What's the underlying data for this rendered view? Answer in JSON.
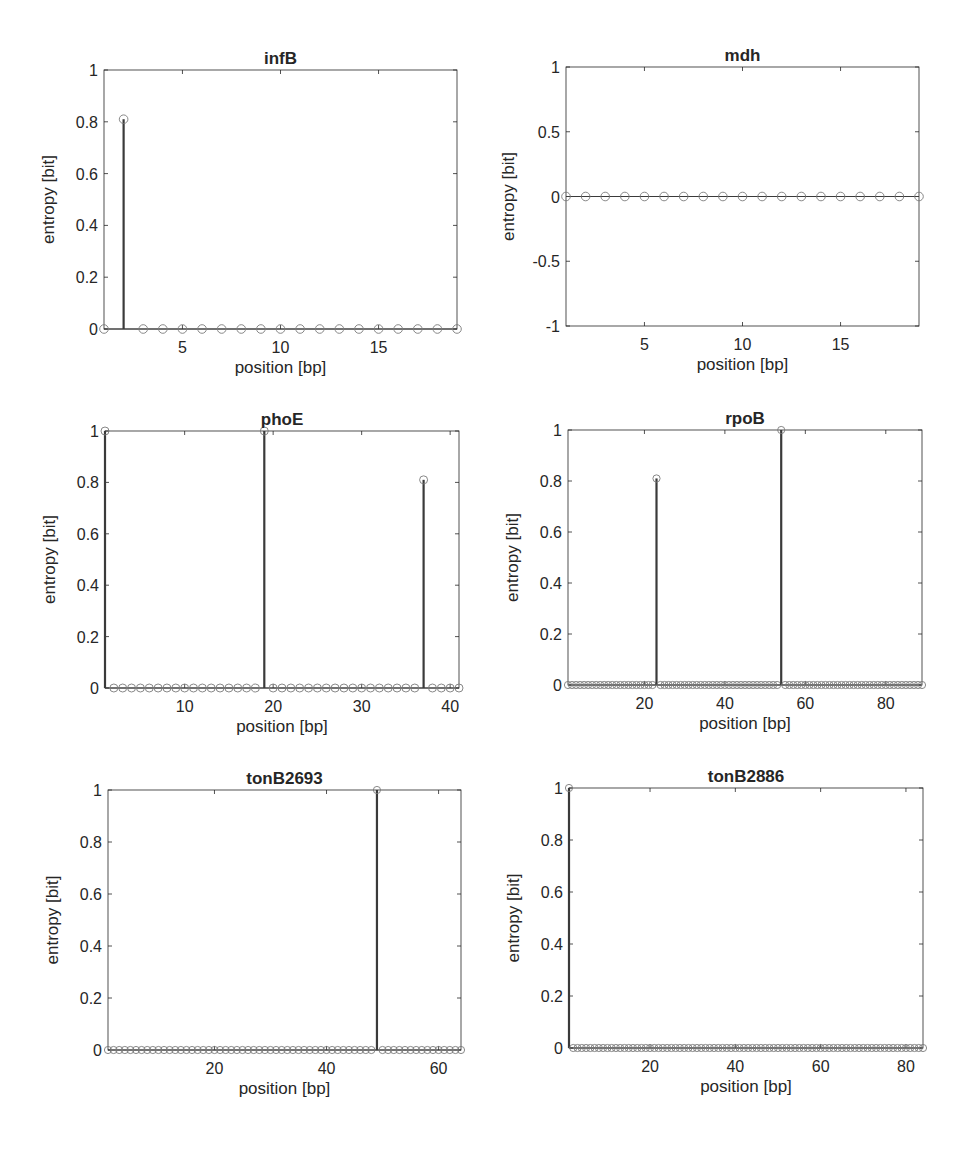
{
  "figure": {
    "width": 963,
    "height": 1150,
    "background": "#ffffff",
    "axis_color": "#262626",
    "stem_color": "#3a3a3a",
    "marker_color": "#7a7a7a"
  },
  "chart_data": [
    {
      "type": "stem",
      "title": "infB",
      "xlabel": "position [bp]",
      "ylabel": "entropy [bit]",
      "xlim": [
        1,
        19
      ],
      "ylim": [
        0,
        1
      ],
      "xticks": [
        5,
        10,
        15
      ],
      "xtick_labels": [
        "5",
        "10",
        "15"
      ],
      "yticks": [
        0,
        0.2,
        0.4,
        0.6,
        0.8,
        1
      ],
      "ytick_labels": [
        "0",
        "0.2",
        "0.4",
        "0.6",
        "0.8",
        "1"
      ],
      "grid": false,
      "x": [
        1,
        2,
        3,
        4,
        5,
        6,
        7,
        8,
        9,
        10,
        11,
        12,
        13,
        14,
        15,
        16,
        17,
        18,
        19
      ],
      "n_points": 19,
      "nonzero": [
        {
          "x": 2,
          "y": 0.81
        }
      ],
      "box": {
        "left": 104,
        "top": 70,
        "right": 457,
        "bottom": 329
      }
    },
    {
      "type": "stem",
      "title": "mdh",
      "xlabel": "position [bp]",
      "ylabel": "entropy [bit]",
      "xlim": [
        1,
        19
      ],
      "ylim": [
        -1,
        1
      ],
      "xticks": [
        5,
        10,
        15
      ],
      "xtick_labels": [
        "5",
        "10",
        "15"
      ],
      "yticks": [
        -1,
        -0.5,
        0,
        0.5,
        1
      ],
      "ytick_labels": [
        "-1",
        "-0.5",
        "0",
        "0.5",
        "1"
      ],
      "grid": false,
      "n_points": 19,
      "nonzero": [],
      "box": {
        "left": 566,
        "top": 67,
        "right": 919,
        "bottom": 326
      }
    },
    {
      "type": "stem",
      "title": "phoE",
      "xlabel": "position [bp]",
      "ylabel": "entropy [bit]",
      "xlim": [
        1,
        41
      ],
      "ylim": [
        0,
        1
      ],
      "xticks": [
        10,
        20,
        30,
        40
      ],
      "xtick_labels": [
        "10",
        "20",
        "30",
        "40"
      ],
      "yticks": [
        0,
        0.2,
        0.4,
        0.6,
        0.8,
        1
      ],
      "ytick_labels": [
        "0",
        "0.2",
        "0.4",
        "0.6",
        "0.8",
        "1"
      ],
      "grid": false,
      "n_points": 41,
      "nonzero": [
        {
          "x": 1,
          "y": 1.0
        },
        {
          "x": 19,
          "y": 1.0
        },
        {
          "x": 37,
          "y": 0.81
        }
      ],
      "box": {
        "left": 105,
        "top": 431,
        "right": 459,
        "bottom": 688
      }
    },
    {
      "type": "stem",
      "title": "rpoB",
      "xlabel": "position [bp]",
      "ylabel": "entropy [bit]",
      "xlim": [
        1,
        89
      ],
      "ylim": [
        0,
        1
      ],
      "xticks": [
        20,
        40,
        60,
        80
      ],
      "xtick_labels": [
        "20",
        "40",
        "60",
        "80"
      ],
      "yticks": [
        0,
        0.2,
        0.4,
        0.6,
        0.8,
        1
      ],
      "ytick_labels": [
        "0",
        "0.2",
        "0.4",
        "0.6",
        "0.8",
        "1"
      ],
      "grid": false,
      "n_points": 89,
      "nonzero": [
        {
          "x": 23,
          "y": 0.81
        },
        {
          "x": 54,
          "y": 1.0
        }
      ],
      "box": {
        "left": 568,
        "top": 430,
        "right": 922,
        "bottom": 685
      }
    },
    {
      "type": "stem",
      "title": "tonB2693",
      "xlabel": "position [bp]",
      "ylabel": "entropy [bit]",
      "xlim": [
        1,
        64
      ],
      "ylim": [
        0,
        1
      ],
      "xticks": [
        20,
        40,
        60
      ],
      "xtick_labels": [
        "20",
        "40",
        "60"
      ],
      "yticks": [
        0,
        0.2,
        0.4,
        0.6,
        0.8,
        1
      ],
      "ytick_labels": [
        "0",
        "0.2",
        "0.4",
        "0.6",
        "0.8",
        "1"
      ],
      "grid": false,
      "n_points": 64,
      "nonzero": [
        {
          "x": 49,
          "y": 1.0
        }
      ],
      "box": {
        "left": 108,
        "top": 790,
        "right": 461,
        "bottom": 1050
      }
    },
    {
      "type": "stem",
      "title": "tonB2886",
      "xlabel": "position [bp]",
      "ylabel": "entropy [bit]",
      "xlim": [
        1,
        84
      ],
      "ylim": [
        0,
        1
      ],
      "xticks": [
        20,
        40,
        60,
        80
      ],
      "xtick_labels": [
        "20",
        "40",
        "60",
        "80"
      ],
      "yticks": [
        0,
        0.2,
        0.4,
        0.6,
        0.8,
        1
      ],
      "ytick_labels": [
        "0",
        "0.2",
        "0.4",
        "0.6",
        "0.8",
        "1"
      ],
      "grid": false,
      "n_points": 84,
      "nonzero": [
        {
          "x": 1,
          "y": 1.0
        }
      ],
      "box": {
        "left": 569,
        "top": 788,
        "right": 923,
        "bottom": 1048
      }
    }
  ]
}
